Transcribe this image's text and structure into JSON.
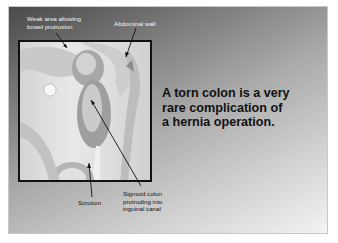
{
  "slide": {
    "headline_lines": [
      "A torn colon is a very",
      "rare complication of",
      "a hernia operation."
    ],
    "labels": {
      "weak_area": [
        "Weak area allowing",
        "bowel protrusion"
      ],
      "abdominal_wall": "Abdominal wall",
      "scrotum": "Scrotum",
      "sigmoid_colon": [
        "Sigmoid colon",
        "protruding into",
        "inguinal canal"
      ]
    },
    "illustration": "anatomical-illustration-inguinal-hernia",
    "colors": {
      "background_dark": "#4a4a4a",
      "background_light": "#f3f3f3",
      "text_dark": "#111111",
      "label_light": "#f4f4f4"
    }
  }
}
